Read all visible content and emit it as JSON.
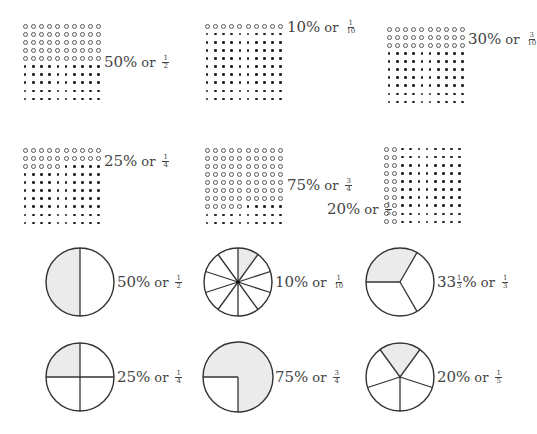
{
  "grids": [
    {
      "id": "grid-50",
      "x": 21,
      "y": 22,
      "filled_open": 50,
      "rows_open_full": 5,
      "label": {
        "percent": "50%",
        "or": "or",
        "num": "1",
        "den": "2",
        "x": 104,
        "y": 53
      }
    },
    {
      "id": "grid-10",
      "x": 203,
      "y": 22,
      "filled_open": 10,
      "label": {
        "percent": "10%",
        "or": "or",
        "num": "1",
        "den": "10",
        "x": 287,
        "y": 18
      }
    },
    {
      "id": "grid-30",
      "x": 385,
      "y": 25,
      "filled_open": 30,
      "label": {
        "percent": "30%",
        "or": "or",
        "num": "3",
        "den": "10",
        "x": 468,
        "y": 30
      }
    },
    {
      "id": "grid-25",
      "x": 21,
      "y": 146,
      "filled_open": 25,
      "label": {
        "percent": "25%",
        "or": "or",
        "num": "1",
        "den": "4",
        "x": 104,
        "y": 152
      }
    },
    {
      "id": "grid-75",
      "x": 203,
      "y": 146,
      "filled_open": 75,
      "label": {
        "percent": "75%",
        "or": "or",
        "num": "3",
        "den": "4",
        "x": 287,
        "y": 176
      }
    },
    {
      "id": "grid-20",
      "x": 382,
      "y": 145,
      "filled_open": 20,
      "column_mode": true,
      "label": {
        "percent": "20%",
        "or": "or",
        "num": "1",
        "den": "5",
        "x": 327,
        "y": 200
      }
    }
  ],
  "pies": [
    {
      "id": "pie-half",
      "cx": 80,
      "cy": 282,
      "r": 34,
      "slices": 2,
      "shaded": [
        0
      ],
      "start_deg": 180,
      "label": {
        "percent": "50%",
        "or": "or",
        "num": "1",
        "den": "2",
        "x": 117,
        "y": 273
      }
    },
    {
      "id": "pie-tenth",
      "cx": 238,
      "cy": 282,
      "r": 34,
      "slices": 10,
      "shaded": [
        0
      ],
      "start_deg": 0,
      "label": {
        "percent": "10%",
        "or": "or",
        "num": "1",
        "den": "10",
        "x": 275,
        "y": 273
      }
    },
    {
      "id": "pie-third",
      "cx": 400,
      "cy": 282,
      "r": 34,
      "slices": 3,
      "shaded": [
        2
      ],
      "start_deg": 30,
      "label": {
        "percent_whole": "33",
        "percent_mix_num": "1",
        "percent_mix_den": "3",
        "percent_sign": "%",
        "or": "or",
        "num": "1",
        "den": "3",
        "x": 437,
        "y": 273
      }
    },
    {
      "id": "pie-quarter",
      "cx": 80,
      "cy": 377,
      "r": 34,
      "slices": 4,
      "shaded": [
        3
      ],
      "start_deg": 0,
      "label": {
        "percent": "25%",
        "or": "or",
        "num": "1",
        "den": "4",
        "x": 117,
        "y": 368
      }
    },
    {
      "id": "pie-three-quarters",
      "cx": 238,
      "cy": 377,
      "r": 35,
      "slices": 4,
      "shaded": [
        2,
        3,
        0
      ],
      "start_deg": 90,
      "label": {
        "percent": "75%",
        "or": "or",
        "num": "3",
        "den": "4",
        "x": 275,
        "y": 368
      }
    },
    {
      "id": "pie-fifth",
      "cx": 400,
      "cy": 377,
      "r": 34,
      "slices": 5,
      "shaded": [
        0
      ],
      "start_deg": -36,
      "label": {
        "percent": "20%",
        "or": "or",
        "num": "1",
        "den": "5",
        "x": 437,
        "y": 368
      }
    }
  ],
  "colors": {
    "stroke": "#333333",
    "shade": "#ebebeb",
    "dot": "#222222"
  }
}
